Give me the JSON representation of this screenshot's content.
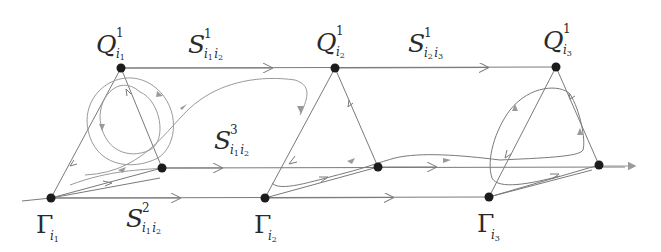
{
  "colors": {
    "background": "#ffffff",
    "node": "#1c1c1c",
    "line": "#7a7a7a",
    "orbit": "#9a9a9a",
    "arrow_fill": "#9a9a9a",
    "text": "#2a2a2a"
  },
  "nodes": [
    {
      "id": "Q_i1",
      "x": 121,
      "y": 68
    },
    {
      "id": "Q_i2",
      "x": 335,
      "y": 68
    },
    {
      "id": "Q_i3",
      "x": 556,
      "y": 67
    },
    {
      "id": "P_i1",
      "x": 162,
      "y": 168
    },
    {
      "id": "P_i2",
      "x": 378,
      "y": 167
    },
    {
      "id": "P_i3",
      "x": 599,
      "y": 165
    },
    {
      "id": "G_i1",
      "x": 51,
      "y": 198
    },
    {
      "id": "G_i2",
      "x": 265,
      "y": 198
    },
    {
      "id": "G_i3",
      "x": 489,
      "y": 197
    }
  ],
  "labels": {
    "q1": {
      "main": "Q",
      "sup": "1",
      "sub": "i",
      "subsub": "1"
    },
    "q2": {
      "main": "Q",
      "sup": "1",
      "sub": "i",
      "subsub": "2"
    },
    "q3": {
      "main": "Q",
      "sup": "1",
      "sub": "i",
      "subsub": "3"
    },
    "s1_12": {
      "main": "S",
      "sup": "1",
      "sub1": "i",
      "subsub1": "1",
      "sub2": "i",
      "subsub2": "2"
    },
    "s1_23": {
      "main": "S",
      "sup": "1",
      "sub1": "i",
      "subsub1": "2",
      "sub2": "i",
      "subsub2": "3"
    },
    "s3_12": {
      "main": "S",
      "sup": "3",
      "sub1": "i",
      "subsub1": "1",
      "sub2": "i",
      "subsub2": "2"
    },
    "s2_12": {
      "main": "S",
      "sup": "2",
      "sub1": "i",
      "subsub1": "1",
      "sub2": "i",
      "subsub2": "2"
    },
    "g1": {
      "main": "Γ",
      "sub": "i",
      "subsub": "1"
    },
    "g2": {
      "main": "Γ",
      "sub": "i",
      "subsub": "2"
    },
    "g3": {
      "main": "Γ",
      "sub": "i",
      "subsub": "3"
    }
  }
}
